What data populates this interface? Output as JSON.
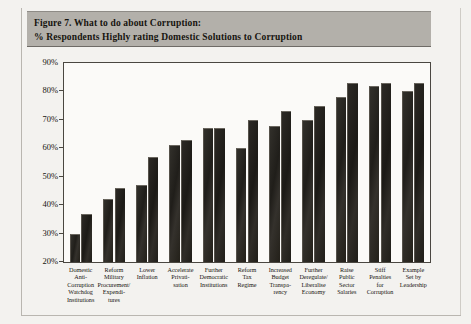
{
  "figure": {
    "title_line1": "Figure 7.  What to do about Corruption:",
    "title_line2": "% Respondents Highly rating Domestic Solutions to Corruption"
  },
  "chart_data": {
    "type": "bar",
    "title": "Figure 7. What to do about Corruption: % Respondents Highly rating Domestic Solutions to Corruption",
    "xlabel": "",
    "ylabel": "",
    "ylim": [
      20,
      90
    ],
    "ytick_labels": [
      "90%",
      "80%",
      "70%",
      "60%",
      "50%",
      "40%",
      "30%",
      "20%"
    ],
    "ytick_values": [
      90,
      80,
      70,
      60,
      50,
      40,
      30,
      20
    ],
    "grid": false,
    "legend": "none",
    "categories": [
      "Domestic Anti-Corruption Watchdog Institutions",
      "Reform Military Procurement/ Expenditures",
      "Lower Inflation",
      "Accelerate Privatisation",
      "Further Democratic Institutions",
      "Reform Tax Regime",
      "Increased Budget Transparency",
      "Further Deregulate/ Liberalise Economy",
      "Raise Public Sector Salaries",
      "Stiff Penalties for Corruption",
      "Example Set by Leadership"
    ],
    "category_lines": [
      [
        "Domestic",
        "Anti-",
        "Corruption",
        "Watchdog",
        "Institutions"
      ],
      [
        "Reform",
        "Military",
        "Procurement/",
        "Expendi-",
        "tures"
      ],
      [
        "Lower",
        "Inflation"
      ],
      [
        "Accelerate",
        "Privati-",
        "sation"
      ],
      [
        "Further",
        "Democratic",
        "Institutions"
      ],
      [
        "Reform",
        "Tax",
        "Regime"
      ],
      [
        "Increased",
        "Budget",
        "Transpa-",
        "rency"
      ],
      [
        "Further",
        "Deregulate/",
        "Liberalise",
        "Economy"
      ],
      [
        "Raise",
        "Public",
        "Sector",
        "Salaries"
      ],
      [
        "Stiff",
        "Penalties",
        "for",
        "Corruption"
      ],
      [
        "Example",
        "Set by",
        "Leadership"
      ]
    ],
    "series": [
      {
        "name": "bar-1",
        "values": [
          30,
          42,
          47,
          61,
          67,
          60,
          68,
          70,
          78,
          82,
          80
        ]
      },
      {
        "name": "bar-2",
        "values": [
          37,
          46,
          57,
          63,
          67,
          70,
          73,
          75,
          83,
          83,
          83
        ]
      }
    ]
  },
  "colors": {
    "banner": "#b3b0aa",
    "bar": "#2a2723",
    "frame": "#4a4741",
    "page": "#f3f2ef"
  }
}
